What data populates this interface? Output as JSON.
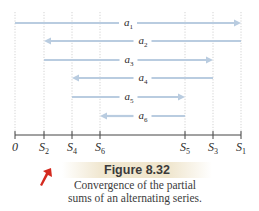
{
  "figure": {
    "number_label": "Figure 8.32",
    "caption_line1": "Convergence of the partial",
    "caption_line2": "sums of an alternating series."
  },
  "axis": {
    "ticks": [
      {
        "label": "0",
        "sub": "",
        "x": 15
      },
      {
        "label": "S",
        "sub": "2",
        "x": 44
      },
      {
        "label": "S",
        "sub": "4",
        "x": 72
      },
      {
        "label": "S",
        "sub": "6",
        "x": 100
      },
      {
        "label": "S",
        "sub": "5",
        "x": 185
      },
      {
        "label": "S",
        "sub": "3",
        "x": 213
      },
      {
        "label": "S",
        "sub": "1",
        "x": 241
      }
    ]
  },
  "arrows": [
    {
      "label": "a",
      "sub": "1",
      "from_x": 15,
      "to_x": 241,
      "y": 23,
      "direction": "right"
    },
    {
      "label": "a",
      "sub": "2",
      "from_x": 241,
      "to_x": 44,
      "y": 41,
      "direction": "left"
    },
    {
      "label": "a",
      "sub": "3",
      "from_x": 44,
      "to_x": 213,
      "y": 60,
      "direction": "right"
    },
    {
      "label": "a",
      "sub": "4",
      "from_x": 213,
      "to_x": 72,
      "y": 78,
      "direction": "left"
    },
    {
      "label": "a",
      "sub": "5",
      "from_x": 72,
      "to_x": 185,
      "y": 97,
      "direction": "right"
    },
    {
      "label": "a",
      "sub": "6",
      "from_x": 185,
      "to_x": 100,
      "y": 116,
      "direction": "left"
    }
  ],
  "colors": {
    "arrow": "#b9cce0",
    "axis": "#444444",
    "guide": "#c8c8c8",
    "pointer": "#d42a1f"
  }
}
